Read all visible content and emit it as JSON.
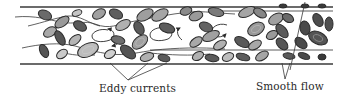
{
  "figure": {
    "labels": {
      "eddy_currents": "Eddy currents",
      "smooth_flow": "Smooth flow"
    },
    "colors": {
      "wall": "#3a3a3a",
      "cell_outline": "#2b2b2b",
      "cell_dark": "#5a5a5a",
      "cell_mid": "#8c8c8c",
      "cell_light": "#c4c4c4",
      "text": "#2a2a2a",
      "background": "#ffffff"
    },
    "regions": [
      {
        "name": "turbulent-region",
        "description": "eddy currents among red blood cells",
        "x_range": [
          20,
          265
        ]
      },
      {
        "name": "laminar-region",
        "description": "smooth flow with cells in orderly lines",
        "x_range": [
          265,
          333
        ]
      }
    ]
  }
}
